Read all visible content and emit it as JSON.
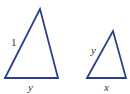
{
  "diagram": {
    "stroke_color": "#2b3f8f",
    "triangles": [
      {
        "name": "large-triangle",
        "points": "5,78 40,9 58,78",
        "labels": [
          {
            "name": "side-label-left",
            "text": "1",
            "x": 11,
            "y": 46,
            "italic": false
          },
          {
            "name": "side-label-bottom",
            "text": "y",
            "x": 28,
            "y": 91,
            "italic": true
          }
        ]
      },
      {
        "name": "small-triangle",
        "points": "87,78 113,31 126,78",
        "labels": [
          {
            "name": "side-label-left",
            "text": "y",
            "x": 91,
            "y": 54,
            "italic": true
          },
          {
            "name": "side-label-bottom",
            "text": "x",
            "x": 104,
            "y": 91,
            "italic": true
          }
        ]
      }
    ]
  }
}
